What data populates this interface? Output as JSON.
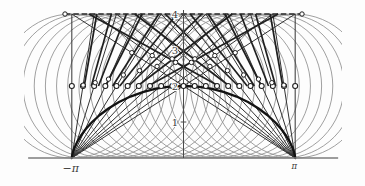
{
  "chart_data": {
    "type": "line",
    "title": "",
    "scale": {
      "origin_px": [
        183.5,
        158.0
      ],
      "px_per_unit_x": 35.55,
      "px_per_unit_y": 36.0
    },
    "clip_px": {
      "x": 24,
      "y": 6,
      "w": 318,
      "h": 164
    },
    "x_axis": {
      "line_range_units": [
        -4.37,
        4.35
      ],
      "ticks": [
        {
          "value": -3.1416,
          "label": "−π"
        },
        {
          "value": 3.1416,
          "label": "π"
        }
      ]
    },
    "y_axis": {
      "range_units": [
        0,
        4.11
      ],
      "ticks": [
        {
          "value": 1,
          "label": "1"
        },
        {
          "value": 2,
          "label": "2"
        },
        {
          "value": 3,
          "label": "3"
        },
        {
          "value": 4,
          "label": "4"
        }
      ]
    },
    "top_line": {
      "y": 4,
      "x_from": -3.333,
      "x_to": 3.333,
      "style": "dashed",
      "end_markers": true
    },
    "circles": {
      "center_y": 2,
      "radius": 2,
      "centers_x": [
        -3.1416,
        -2.8274,
        -2.5133,
        -2.1991,
        -1.885,
        -1.5708,
        -1.2566,
        -0.9425,
        -0.6283,
        -0.3142,
        0,
        0.3142,
        0.6283,
        0.9425,
        1.2566,
        1.5708,
        1.885,
        2.1991,
        2.5133,
        2.8274,
        3.1416
      ]
    },
    "center_markers_y": 2,
    "cusp_chords": {
      "left_cusp": [
        -3.1416,
        0
      ],
      "right_cusp": [
        3.1416,
        0
      ],
      "top_y": 4,
      "top_x_from_left": [
        -3.1416,
        -2.5133,
        -1.885,
        -1.2566,
        -0.6283,
        0,
        0.6283,
        1.2566,
        1.885,
        2.5133,
        3.1416
      ],
      "top_x_from_right": [
        3.1416,
        2.5133,
        1.885,
        1.2566,
        0.6283,
        0,
        -0.6283,
        -1.2566,
        -1.885,
        -2.5133,
        -3.1416
      ]
    },
    "chord_markers": [
      [
        -2.8237,
        2.0243
      ],
      [
        -2.4845,
        2.0919
      ],
      [
        -2.1092,
        2.1908
      ],
      [
        -1.6923,
        2.3066
      ],
      [
        -1.2355,
        2.4269
      ],
      [
        -0.7435,
        2.5446
      ],
      [
        -0.223,
        2.6544
      ],
      [
        0.32,
        2.7546
      ],
      [
        0.8804,
        2.845
      ],
      [
        1.4544,
        2.926
      ],
      [
        2.8237,
        2.0243
      ],
      [
        2.4845,
        2.0919
      ],
      [
        2.1092,
        2.1908
      ],
      [
        1.6923,
        2.3066
      ],
      [
        1.2355,
        2.4269
      ],
      [
        0.7435,
        2.5446
      ],
      [
        0.223,
        2.6544
      ],
      [
        -0.32,
        2.7546
      ],
      [
        -0.8804,
        2.845
      ],
      [
        -1.4544,
        2.926
      ]
    ],
    "tangent_segments": [
      [
        -2.7916,
        2,
        -2.438,
        4
      ],
      [
        -2.5916,
        2,
        -2.0282,
        4
      ],
      [
        -2.3916,
        2,
        -1.6044,
        4
      ],
      [
        -2.1916,
        2,
        -1.1608,
        4
      ],
      [
        -1.9916,
        2,
        -0.6968,
        4
      ],
      [
        -1.7916,
        2,
        -0.1904,
        4
      ],
      [
        -1.5416,
        2,
        0.5176,
        4
      ],
      [
        -1.2916,
        2,
        1.3708,
        4
      ],
      [
        -0.9916,
        2,
        2.6604,
        4
      ],
      [
        2.7916,
        2,
        2.438,
        4
      ],
      [
        2.5916,
        2,
        2.0282,
        4
      ],
      [
        2.3916,
        2,
        1.6044,
        4
      ],
      [
        2.1916,
        2,
        1.1608,
        4
      ],
      [
        1.9916,
        2,
        0.6968,
        4
      ],
      [
        1.7916,
        2,
        0.1904,
        4
      ],
      [
        1.5416,
        2,
        -0.5176,
        4
      ],
      [
        1.2916,
        2,
        -1.3708,
        4
      ],
      [
        0.9916,
        2,
        -2.6604,
        4
      ]
    ],
    "cycloid": {
      "points": [
        [
          -3.142,
          0
        ],
        [
          -3.14,
          0.019
        ],
        [
          -3.132,
          0.076
        ],
        [
          -3.108,
          0.169
        ],
        [
          -3.063,
          0.293
        ],
        [
          -2.991,
          0.444
        ],
        [
          -2.887,
          0.617
        ],
        [
          -2.748,
          0.805
        ],
        [
          -2.571,
          1.0
        ],
        [
          -2.355,
          1.195
        ],
        [
          -2.102,
          1.383
        ],
        [
          -1.813,
          1.556
        ],
        [
          -1.493,
          1.707
        ],
        [
          -1.145,
          1.831
        ],
        [
          -0.775,
          1.924
        ],
        [
          -0.392,
          1.981
        ],
        [
          0,
          2.0
        ],
        [
          0.392,
          1.981
        ],
        [
          0.775,
          1.924
        ],
        [
          1.145,
          1.831
        ],
        [
          1.493,
          1.707
        ],
        [
          1.813,
          1.556
        ],
        [
          2.102,
          1.383
        ],
        [
          2.355,
          1.195
        ],
        [
          2.571,
          1.0
        ],
        [
          2.748,
          0.805
        ],
        [
          2.887,
          0.617
        ],
        [
          2.991,
          0.444
        ],
        [
          3.063,
          0.293
        ],
        [
          3.108,
          0.169
        ],
        [
          3.132,
          0.076
        ],
        [
          3.14,
          0.019
        ],
        [
          3.142,
          0
        ]
      ]
    },
    "style": {
      "circle_color": "#8f8f8f",
      "chord_color": "#323232",
      "tangent_color": "#1f1f1f",
      "cycloid_color": "#121212",
      "x_axis_color": "#7d7d7d",
      "y_axis_color": "#4a4a4a",
      "top_line_color": "#2e2e2e",
      "marker_fill": "#ffffff",
      "marker_stroke": "#1d1d1d",
      "label_color": "#3a3a3a"
    }
  }
}
